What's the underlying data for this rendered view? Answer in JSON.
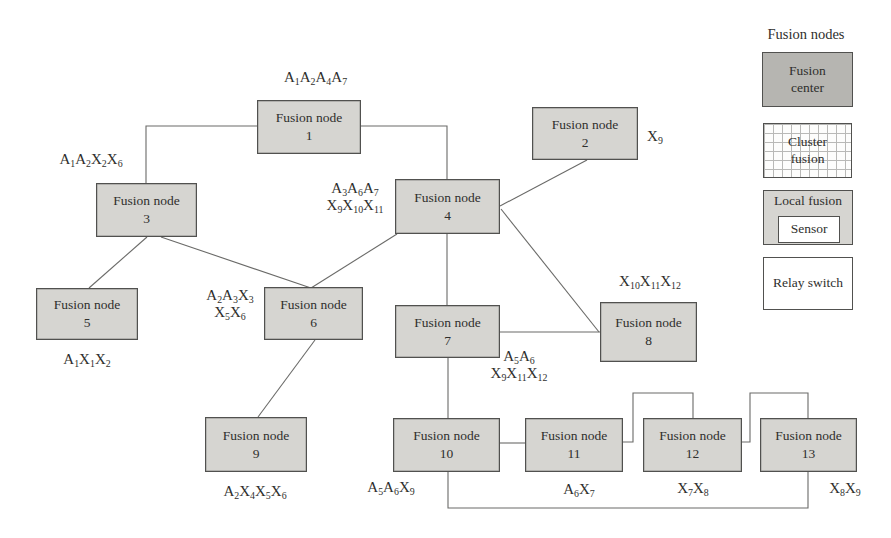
{
  "figure": {
    "nodes": {
      "n1": {
        "title": "Fusion node",
        "num": "1"
      },
      "n2": {
        "title": "Fusion node",
        "num": "2"
      },
      "n3": {
        "title": "Fusion node",
        "num": "3"
      },
      "n4": {
        "title": "Fusion node",
        "num": "4"
      },
      "n5": {
        "title": "Fusion node",
        "num": "5"
      },
      "n6": {
        "title": "Fusion node",
        "num": "6"
      },
      "n7": {
        "title": "Fusion node",
        "num": "7"
      },
      "n8": {
        "title": "Fusion node",
        "num": "8"
      },
      "n9": {
        "title": "Fusion node",
        "num": "9"
      },
      "n10": {
        "title": "Fusion node",
        "num": "10"
      },
      "n11": {
        "title": "Fusion node",
        "num": "11"
      },
      "n12": {
        "title": "Fusion node",
        "num": "12"
      },
      "n13": {
        "title": "Fusion node",
        "num": "13"
      }
    },
    "annotations": {
      "n1": "A_1A_2A_4A_7",
      "n2": "X_9",
      "n3": "A_1A_2X_2X_6",
      "n4_1": "A_3A_6A_7",
      "n4_2": "X_9X_10X_11",
      "n5": "A_1X_1X_2",
      "n6_1": "A_2A_3X_3",
      "n6_2": "X_5X_6",
      "n7_1": "A_5A_6",
      "n7_2": "X_9X_11X_12",
      "n8": "X_10X_11X_12",
      "n9": "A_2X_4X_5X_6",
      "n10": "A_5A_6X_9",
      "n11": "A_6X_7",
      "n12": "X_7X_8",
      "n13": "X_8X_9"
    },
    "legend": {
      "title": "Fusion nodes",
      "fusion_center_1": "Fusion",
      "fusion_center_2": "center",
      "cluster_fusion_1": "Cluster",
      "cluster_fusion_2": "fusion",
      "local_fusion": "Local fusion",
      "sensor": "Sensor",
      "relay_switch": "Relay switch"
    },
    "colors": {
      "node_fill": "#d6d5d1",
      "fusion_center_fill": "#b6b5b1",
      "box_border": "#51514f",
      "connector_line": "#6a6a68",
      "text": "#2f2f2d",
      "grid_line": "#b9b9b7",
      "background": "#ffffff"
    }
  }
}
